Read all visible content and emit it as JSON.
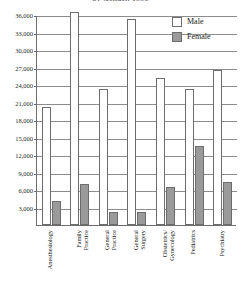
{
  "chart_data": {
    "type": "bar",
    "title": "by Gender, 1998",
    "xlabel": "",
    "ylabel": "",
    "ylim": [
      0,
      36000
    ],
    "ytick_labels": [
      "36,000",
      "33,000",
      "30,000",
      "27,000",
      "24,000",
      "21,000",
      "18,000",
      "15,000",
      "12,000",
      "9,000",
      "6,000",
      "3,000"
    ],
    "ytick_values": [
      36000,
      33000,
      30000,
      27000,
      24000,
      21000,
      18000,
      15000,
      12000,
      9000,
      6000,
      3000
    ],
    "grid": true,
    "legend_position": "top-right",
    "categories": [
      "Anesthesiology",
      "Family Practice",
      "General Practice",
      "General Surgery",
      "Obstetrics/ Gynecology",
      "Pediatrics",
      "Psychiatry"
    ],
    "category_lines": [
      [
        "Anesthesiology"
      ],
      [
        "Family",
        "Practice"
      ],
      [
        "General",
        "Practice"
      ],
      [
        "General",
        "Surgery"
      ],
      [
        "Obstetrics/",
        "Gynecology"
      ],
      [
        "Pediatrics"
      ],
      [
        "Psychiatry"
      ]
    ],
    "series": [
      {
        "name": "Male",
        "color": "#ffffff",
        "values": [
          20300,
          36500,
          23400,
          35400,
          25200,
          23400,
          26500
        ]
      },
      {
        "name": "Female",
        "color": "#9a9a9a",
        "values": [
          4200,
          7000,
          2300,
          2300,
          6600,
          13500,
          7300
        ]
      }
    ]
  },
  "legend": {
    "items": [
      {
        "label": "Male",
        "swatch": "male"
      },
      {
        "label": "Female",
        "swatch": "female"
      }
    ]
  }
}
